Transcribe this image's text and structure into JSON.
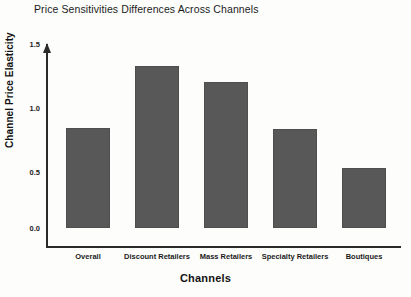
{
  "chart_data": {
    "type": "bar",
    "title": "Price Sensitivities Differences Across Channels",
    "xlabel": "Channels",
    "ylabel": "Channel Price Elasticity",
    "categories": [
      "Overall",
      "Discount Retailers",
      "Mass Retailers",
      "Specialty Retailers",
      "Boutiques"
    ],
    "values": [
      0.81,
      1.31,
      1.18,
      0.8,
      0.48
    ],
    "ylim": [
      0.0,
      1.5
    ],
    "yticks": [
      0.0,
      0.5,
      1.0,
      1.5
    ],
    "ytick_labels": [
      "0.0",
      "0.5",
      "1.0",
      "1.5"
    ],
    "grid": false,
    "legend": null,
    "bar_color": "#585858",
    "axis_color": "#2b2b2b",
    "background_color": "#fdfdfb"
  }
}
